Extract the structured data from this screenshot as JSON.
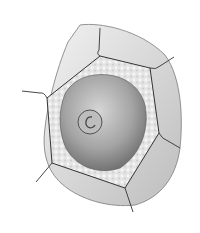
{
  "diagram": {
    "parts": [
      {
        "name": "neighbor-cells"
      },
      {
        "name": "cell-wall"
      },
      {
        "name": "cytoplasm"
      },
      {
        "name": "vacuole"
      },
      {
        "name": "nucleus"
      },
      {
        "name": "nucleolus"
      }
    ],
    "colors": {
      "background": "#ffffff",
      "neighbor": "#cfcfcf",
      "wall": "#e6e6e6",
      "vacuole_light": "#d8d8d8",
      "vacuole_dark": "#7a7a7a",
      "outline": "#333333"
    }
  }
}
